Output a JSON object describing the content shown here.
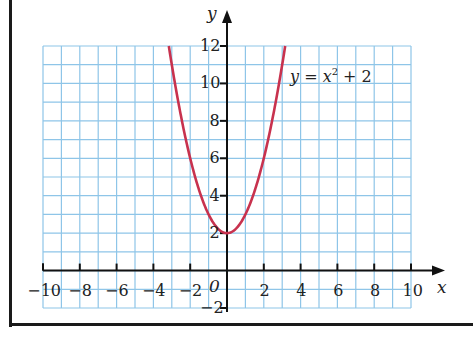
{
  "chart_data": {
    "type": "line",
    "title": "",
    "equation_label": {
      "lhs": "y",
      "eq": " = ",
      "var": "x",
      "exp": "2",
      "rest": " + 2"
    },
    "xlabel": "x",
    "ylabel": "y",
    "xlim": [
      -10,
      10
    ],
    "ylim": [
      -2,
      12
    ],
    "grid": true,
    "grid_color": "#8ec5e8",
    "curve_color": "#c8324e",
    "x_ticks": [
      -10,
      -8,
      -6,
      -4,
      -2,
      2,
      4,
      6,
      8,
      10
    ],
    "x_tick_labels": [
      "−10",
      "−8",
      "−6",
      "−4",
      "−2",
      "2",
      "4",
      "6",
      "8",
      "10"
    ],
    "y_ticks": [
      -2,
      2,
      4,
      6,
      8,
      10,
      12
    ],
    "y_tick_labels": [
      "−2",
      "2",
      "4",
      "6",
      "8",
      "10",
      "12"
    ],
    "origin_label": "0",
    "series": [
      {
        "name": "y = x^2 + 2",
        "x": [
          -3.16,
          -3,
          -2.5,
          -2,
          -1.5,
          -1,
          -0.5,
          0,
          0.5,
          1,
          1.5,
          2,
          2.5,
          3,
          3.16
        ],
        "y": [
          12,
          11,
          8.25,
          6,
          4.25,
          3,
          2.25,
          2,
          2.25,
          3,
          4.25,
          6,
          8.25,
          11,
          12
        ]
      }
    ]
  }
}
